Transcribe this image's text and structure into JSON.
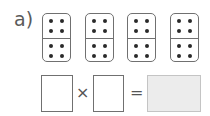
{
  "exercise": {
    "label": "a)",
    "dominoes": [
      {
        "top_pips": 4,
        "bottom_pips": 4
      },
      {
        "top_pips": 4,
        "bottom_pips": 4
      },
      {
        "top_pips": 4,
        "bottom_pips": 4
      },
      {
        "top_pips": 4,
        "bottom_pips": 4
      }
    ],
    "equation": {
      "factor1": "",
      "operator_times": "×",
      "factor2": "",
      "operator_equals": "=",
      "result": ""
    },
    "colors": {
      "border": "#707070",
      "pip": "#2a2a2a",
      "result_fill": "#ececec"
    }
  }
}
